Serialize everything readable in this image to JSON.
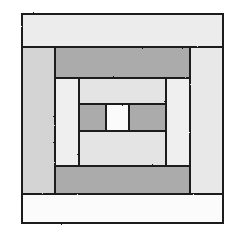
{
  "canvas": {
    "width": 236,
    "height": 242,
    "background": "#ffffff",
    "title": "Log Cabin Quilt Block",
    "description": "Concentric rectangular quilt block, courthouse-steps / log-cabin construction, rendered in grayscale with hand-drawn black outlines."
  },
  "palette": {
    "outline": "#1a1a1a",
    "white": "#fbfbfb",
    "light": "#ececec",
    "light_gray": "#e2e2e2",
    "gray": "#d4d4d4",
    "medium_gray": "#ababab",
    "background": "#ffffff"
  },
  "block": {
    "name": "log-cabin-block",
    "rounds": [
      {
        "round": 1,
        "name": "outer-round",
        "pieces": [
          {
            "name": "outer-top-strip",
            "fill_key": "light",
            "fill": "#ececec",
            "x": 22,
            "y": 14,
            "width": 201,
            "height": 33,
            "label": "outer top light strip"
          },
          {
            "name": "outer-left-strip",
            "fill_key": "gray",
            "fill": "#d4d4d4",
            "x": 22,
            "y": 47,
            "width": 33,
            "height": 147,
            "label": "outer left gray strip"
          },
          {
            "name": "outer-right-strip",
            "fill_key": "light_gray",
            "fill": "#e8e8e8",
            "x": 190,
            "y": 47,
            "width": 33,
            "height": 147,
            "label": "outer right light strip"
          },
          {
            "name": "outer-bottom-strip",
            "fill_key": "white",
            "fill": "#fbfbfb",
            "x": 22,
            "y": 194,
            "width": 201,
            "height": 29,
            "label": "outer bottom white strip"
          }
        ]
      },
      {
        "round": 2,
        "name": "second-round",
        "pieces": [
          {
            "name": "second-top-strip",
            "fill_key": "medium_gray",
            "fill": "#ababab",
            "x": 55,
            "y": 47,
            "width": 135,
            "height": 31,
            "label": "second round top medium-gray strip"
          },
          {
            "name": "second-left-strip",
            "fill_key": "light",
            "fill": "#efefef",
            "x": 55,
            "y": 78,
            "width": 24,
            "height": 88,
            "label": "second round left light strip"
          },
          {
            "name": "second-right-strip",
            "fill_key": "light",
            "fill": "#efefef",
            "x": 166,
            "y": 78,
            "width": 24,
            "height": 88,
            "label": "second round right light strip"
          },
          {
            "name": "second-bottom-strip",
            "fill_key": "medium_gray",
            "fill": "#ababab",
            "x": 55,
            "y": 166,
            "width": 135,
            "height": 28,
            "label": "second round bottom medium-gray strip"
          }
        ]
      },
      {
        "round": 3,
        "name": "third-round",
        "pieces": [
          {
            "name": "third-top-strip",
            "fill_key": "light_gray",
            "fill": "#e4e4e4",
            "x": 79,
            "y": 78,
            "width": 87,
            "height": 26,
            "label": "third round top light strip"
          },
          {
            "name": "third-bottom-strip",
            "fill_key": "light_gray",
            "fill": "#e4e4e4",
            "x": 79,
            "y": 131,
            "width": 87,
            "height": 35,
            "label": "third round bottom light strip"
          }
        ]
      },
      {
        "round": 4,
        "name": "center-round",
        "pieces": [
          {
            "name": "center-left-block",
            "fill_key": "medium_gray",
            "fill": "#ababab",
            "x": 79,
            "y": 104,
            "width": 27,
            "height": 27,
            "label": "center left medium-gray block"
          },
          {
            "name": "center-square",
            "fill_key": "white",
            "fill": "#fbfbfb",
            "x": 106,
            "y": 104,
            "width": 23,
            "height": 27,
            "label": "center white square"
          },
          {
            "name": "center-right-block",
            "fill_key": "medium_gray",
            "fill": "#ababab",
            "x": 129,
            "y": 104,
            "width": 37,
            "height": 27,
            "label": "center right medium-gray block"
          }
        ]
      }
    ],
    "outline_width": 2.4,
    "piece_count": 13
  }
}
